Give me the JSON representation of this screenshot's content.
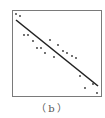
{
  "figure": {
    "caption": "（b）"
  },
  "colors": {
    "frame": "#7a7a7a",
    "points": "#333333",
    "line": "#222222",
    "background": "#ffffff"
  },
  "chart_data": {
    "type": "scatter",
    "title": "",
    "xlabel": "",
    "ylabel": "",
    "grid": false,
    "legend": null,
    "annotation": "(b)",
    "frame_px": {
      "x0": 12,
      "y0": 10,
      "x1": 101,
      "y1": 96
    },
    "points_px": [
      [
        16,
        14
      ],
      [
        20,
        16
      ],
      [
        24,
        35
      ],
      [
        28,
        35
      ],
      [
        33,
        41
      ],
      [
        37,
        48
      ],
      [
        41,
        48
      ],
      [
        45,
        53
      ],
      [
        50,
        40
      ],
      [
        54,
        57
      ],
      [
        58,
        45
      ],
      [
        63,
        51
      ],
      [
        67,
        53
      ],
      [
        72,
        56
      ],
      [
        76,
        58
      ],
      [
        80,
        76
      ],
      [
        85,
        88
      ],
      [
        93,
        84
      ],
      [
        97,
        93
      ]
    ],
    "fit_line_px": {
      "x1": 16,
      "y1": 20,
      "x2": 98,
      "y2": 86
    },
    "trend": "negative linear"
  }
}
